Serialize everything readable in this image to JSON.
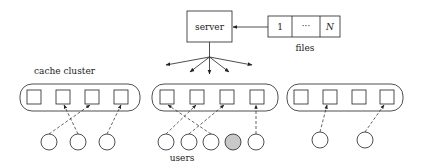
{
  "server": {
    "label": "server"
  },
  "files": {
    "label": "files",
    "cells": [
      "1",
      "···",
      "N"
    ]
  },
  "cluster_label": "cache cluster",
  "users_label": "users",
  "colors": {
    "stroke": "#222222",
    "highlighted_user": "#c8c8c8"
  },
  "clusters": [
    {
      "id": "left",
      "caches": 4,
      "users": 3
    },
    {
      "id": "middle",
      "caches": 4,
      "users": 5,
      "highlighted_user_index": 3
    },
    {
      "id": "right",
      "caches": 4,
      "users": 2
    }
  ]
}
